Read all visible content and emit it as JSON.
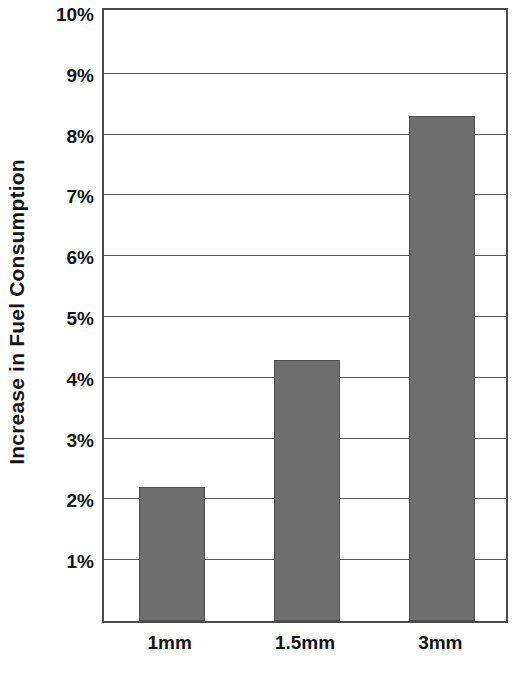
{
  "chart_data": {
    "type": "bar",
    "title": "",
    "subtitle": "",
    "xlabel": "",
    "ylabel": "Increase in Fuel Consumption",
    "categories": [
      "1mm",
      "1.5mm",
      "3mm"
    ],
    "values": [
      2.2,
      4.3,
      8.3
    ],
    "value_unit": "%",
    "series": [
      {
        "name": "Increase in Fuel Consumption",
        "values": [
          2.2,
          4.3,
          8.3
        ]
      }
    ],
    "ylim": [
      0,
      10
    ],
    "y_tick_values": [
      1,
      2,
      3,
      4,
      5,
      6,
      7,
      8,
      9,
      10
    ],
    "y_tick_labels": [
      "1%",
      "2%",
      "3%",
      "4%",
      "5%",
      "6%",
      "7%",
      "8%",
      "9%",
      "10%"
    ],
    "grid": true,
    "grid_axis": "y",
    "legend": false,
    "legend_position": "none",
    "bar_color": "#6e6e6e",
    "bar_edge_color": "#4f4f4f",
    "axis_color": "#4a4a4a",
    "gridline_color": "#5a5a5a",
    "background_color": "#ffffff",
    "text_color": "#141414",
    "annotations": []
  },
  "axes": {
    "y_title": "Increase in Fuel Consumption"
  }
}
